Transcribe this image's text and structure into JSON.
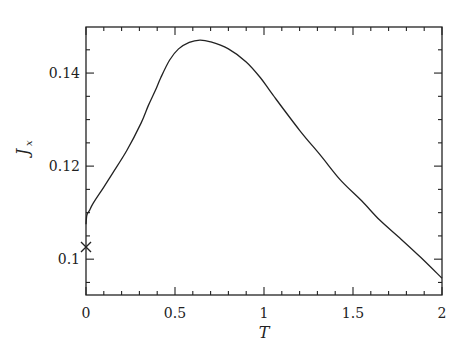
{
  "chart_data": {
    "type": "line",
    "title": "",
    "xlabel": "T",
    "ylabel": "J_x",
    "ylabel_main": "J",
    "ylabel_sub": "x",
    "xlim": [
      0,
      2
    ],
    "ylim": [
      0.0923,
      0.1499
    ],
    "grid": false,
    "legend": null,
    "x_ticks": [
      {
        "value": 0,
        "label": "0"
      },
      {
        "value": 0.5,
        "label": "0.5"
      },
      {
        "value": 1,
        "label": "1"
      },
      {
        "value": 1.5,
        "label": "1.5"
      },
      {
        "value": 2,
        "label": "2"
      }
    ],
    "x_minor_step": 0.1,
    "y_ticks": [
      {
        "value": 0.1,
        "label": "0.1"
      },
      {
        "value": 0.12,
        "label": "0.12"
      },
      {
        "value": 0.14,
        "label": "0.14"
      }
    ],
    "y_minor_step": 0.005,
    "series": [
      {
        "name": "J_x(T)",
        "style": "solid",
        "color": "#222222",
        "x": [
          0.0,
          0.005,
          0.02,
          0.04,
          0.1,
          0.15,
          0.23,
          0.31,
          0.35,
          0.39,
          0.42,
          0.47,
          0.52,
          0.58,
          0.64,
          0.7,
          0.8,
          0.9,
          0.98,
          1.05,
          1.2,
          1.32,
          1.43,
          1.55,
          1.65,
          1.77,
          1.88,
          2.0
        ],
        "y": [
          0.1075,
          0.1095,
          0.1105,
          0.112,
          0.1155,
          0.1185,
          0.1234,
          0.1293,
          0.133,
          0.1363,
          0.139,
          0.1428,
          0.1452,
          0.1466,
          0.1471,
          0.1467,
          0.1452,
          0.1424,
          0.139,
          0.1353,
          0.1277,
          0.1222,
          0.117,
          0.1125,
          0.1084,
          0.1043,
          0.1004,
          0.0959
        ]
      }
    ],
    "markers": [
      {
        "name": "T0-marker",
        "symbol": "x",
        "x": 0,
        "y": 0.1026
      }
    ]
  }
}
